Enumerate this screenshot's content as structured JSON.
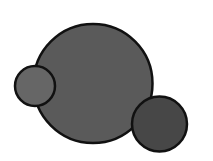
{
  "canvas": {
    "width": 213,
    "height": 161,
    "background": "#ffffff"
  },
  "stroke": {
    "color": "#111111",
    "width": 2.5
  },
  "circles": [
    {
      "name": "large-circle",
      "cx": 93,
      "cy": 83.5,
      "r": 59.5,
      "fill": "#5a5a5a"
    },
    {
      "name": "small-left-circle",
      "cx": 35,
      "cy": 86,
      "r": 20,
      "fill": "#666666"
    },
    {
      "name": "right-circle",
      "cx": 159.5,
      "cy": 124,
      "r": 27.5,
      "fill": "#474747"
    }
  ]
}
